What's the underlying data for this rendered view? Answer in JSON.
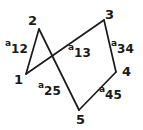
{
  "figure": {
    "type": "graph-diagram",
    "background_color": "#ffffff",
    "stroke_color": "#1a1a1a",
    "text_color": "#1a1a1a",
    "width": 143,
    "height": 130
  },
  "nodes": [
    {
      "id": "1",
      "label": "1",
      "x": 26,
      "y": 74,
      "label_x": 14,
      "label_y": 73
    },
    {
      "id": "2",
      "label": "2",
      "x": 39,
      "y": 29,
      "label_x": 28,
      "label_y": 14
    },
    {
      "id": "3",
      "label": "3",
      "x": 104,
      "y": 20,
      "label_x": 105,
      "label_y": 8
    },
    {
      "id": "4",
      "label": "4",
      "x": 116,
      "y": 72,
      "label_x": 122,
      "label_y": 65
    },
    {
      "id": "5",
      "label": "5",
      "x": 79,
      "y": 110,
      "label_x": 76,
      "label_y": 113
    }
  ],
  "edges": [
    {
      "id": "e12",
      "from": "1",
      "to": "2",
      "label_a": "a",
      "label_sub": "12",
      "label_x": 5,
      "label_y": 40
    },
    {
      "id": "e13",
      "from": "1",
      "to": "3",
      "label_a": "a",
      "label_sub": "13",
      "label_x": 68,
      "label_y": 44
    },
    {
      "id": "e25",
      "from": "2",
      "to": "5",
      "label_a": "a",
      "label_sub": "25",
      "label_x": 38,
      "label_y": 82
    },
    {
      "id": "e34",
      "from": "3",
      "to": "4",
      "label_a": "a",
      "label_sub": "34",
      "label_x": 111,
      "label_y": 40
    },
    {
      "id": "e45",
      "from": "4",
      "to": "5",
      "label_a": "a",
      "label_sub": "45",
      "label_x": 99,
      "label_y": 86
    }
  ]
}
